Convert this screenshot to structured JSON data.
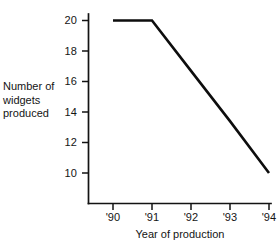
{
  "chart_data": {
    "type": "line",
    "title": "",
    "xlabel": "Year of production",
    "ylabel": "Number of widgets produced",
    "x": [
      "'90",
      "'91",
      "'92",
      "'93",
      "'94"
    ],
    "values": [
      20,
      20,
      16.7,
      13.4,
      10
    ],
    "xtick_labels": [
      "'90",
      "'91",
      "'92",
      "'93",
      "'94"
    ],
    "ytick_labels": [
      "20",
      "18",
      "16",
      "14",
      "12",
      "10"
    ],
    "ytick_values": [
      20,
      18,
      16,
      14,
      12,
      10
    ],
    "ylim": [
      9,
      21
    ],
    "xlim": [
      "'90",
      "'94"
    ],
    "grid": false,
    "legend": false,
    "series": [
      {
        "name": "Widgets produced",
        "values": [
          20,
          20,
          16.7,
          13.4,
          10
        ]
      }
    ],
    "annotations": [],
    "line_color": "#0d0d0d"
  },
  "axis": {
    "ylabel_line1": "Number of",
    "ylabel_line2": "widgets",
    "ylabel_line3": "produced",
    "xlabel": "Year of production",
    "ytick_0": "20",
    "ytick_1": "18",
    "ytick_2": "16",
    "ytick_3": "14",
    "ytick_4": "12",
    "ytick_5": "10",
    "xtick_0": "'90",
    "xtick_1": "'91",
    "xtick_2": "'92",
    "xtick_3": "'93",
    "xtick_4": "'94"
  }
}
